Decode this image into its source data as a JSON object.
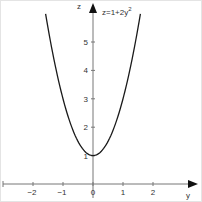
{
  "chart_data": {
    "type": "line",
    "annotation": {
      "base": "z=1+2y",
      "exponent": "2"
    },
    "xlabel": "y",
    "ylabel": "z",
    "xlim": [
      -2.9,
      3.0
    ],
    "ylim": [
      0,
      6.2
    ],
    "x_ticks": [
      "-2",
      "-1",
      "0",
      "1",
      "2"
    ],
    "y_ticks": [
      "1",
      "2",
      "3",
      "4",
      "5"
    ],
    "grid": false,
    "series": [
      {
        "name": "z=1+2y^2",
        "x": [
          -1.58,
          -1.4,
          -1.2,
          -1.0,
          -0.8,
          -0.6,
          -0.4,
          -0.2,
          0,
          0.2,
          0.4,
          0.6,
          0.8,
          1.0,
          1.2,
          1.4,
          1.58
        ],
        "values": [
          5.99,
          4.92,
          3.88,
          3.0,
          2.28,
          1.72,
          1.32,
          1.08,
          1.0,
          1.08,
          1.32,
          1.72,
          2.28,
          3.0,
          3.88,
          4.92,
          5.99
        ]
      }
    ],
    "colors": {
      "curve": "#1a1a1a",
      "axis": "#666666",
      "arrow": "#111111"
    }
  }
}
